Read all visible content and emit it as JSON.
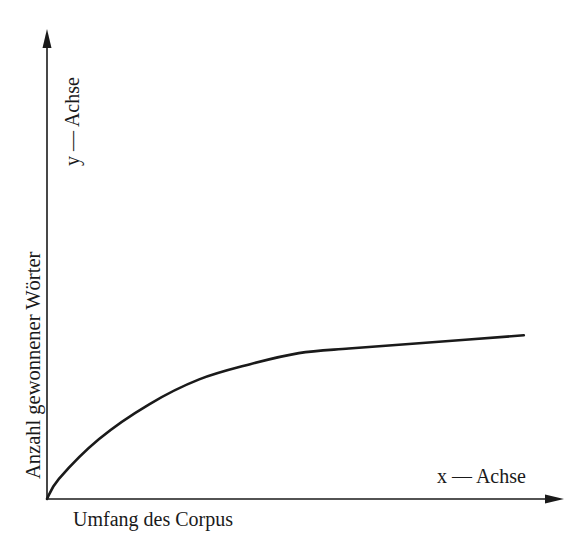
{
  "chart_data": {
    "type": "line",
    "title": "",
    "xlabel": "Umfang des Corpus",
    "ylabel": "Anzahl gewonnener Wörter",
    "x_axis_name": "x — Achse",
    "y_axis_name": "y — Achse",
    "xlim": [
      0,
      100
    ],
    "ylim": [
      0,
      100
    ],
    "grid": false,
    "legend": null,
    "ticks": false,
    "series": [
      {
        "name": "Anzahl gewonnener Wörter",
        "x": [
          0,
          2.3,
          10.1,
          19.8,
          29.5,
          39.2,
          48.8,
          58.5,
          72.1,
          92.4
        ],
        "y": [
          0,
          4.3,
          12.8,
          20.2,
          25.5,
          28.7,
          31.1,
          32.1,
          33.2,
          34.9
        ]
      }
    ],
    "curve_shape": "concave saturation curve rising from origin and flattening toward a plateau",
    "pixel_geometry": {
      "origin": [
        47,
        499
      ],
      "x_axis_end": [
        563,
        499
      ],
      "y_axis_end": [
        47,
        30
      ]
    }
  },
  "labels": {
    "y_axis_name": "y — Achse",
    "y_axis_title": "Anzahl gewonnener Wörter",
    "x_axis_name": "x — Achse",
    "x_axis_title": "Umfang des Corpus"
  }
}
